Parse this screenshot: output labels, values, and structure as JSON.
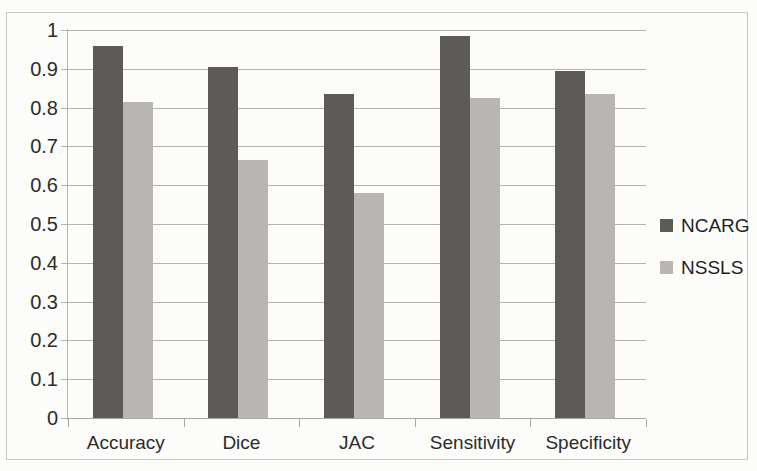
{
  "chart_data": {
    "type": "bar",
    "title": "",
    "subtitle": "",
    "xlabel": "",
    "ylabel": "",
    "categories": [
      "Accuracy",
      "Dice",
      "JAC",
      "Sensitivity",
      "Specificity"
    ],
    "series": [
      {
        "name": "NCARG",
        "color": "#5e5a57",
        "values": [
          0.96,
          0.905,
          0.835,
          0.985,
          0.895
        ]
      },
      {
        "name": "NSSLS",
        "color": "#b8b5b2",
        "values": [
          0.815,
          0.665,
          0.58,
          0.825,
          0.835
        ]
      }
    ],
    "ylim": [
      0,
      1
    ],
    "ytick_labels": [
      "1",
      "0.9",
      "0.8",
      "0.7",
      "0.6",
      "0.5",
      "0.4",
      "0.3",
      "0.2",
      "0.1",
      "0"
    ],
    "ytick_values": [
      1,
      0.9,
      0.8,
      0.7,
      0.6,
      0.5,
      0.4,
      0.3,
      0.2,
      0.1,
      0
    ],
    "grid": true,
    "grid_axis": "y",
    "legend_position": "right",
    "legend_entries": [
      "NCARG",
      "NSSLS"
    ],
    "background_color": "#fcfcfb",
    "gridline_color": "#b6b4b1",
    "axis_color": "#a9a7a4",
    "text_color": "#2b2b2b"
  }
}
